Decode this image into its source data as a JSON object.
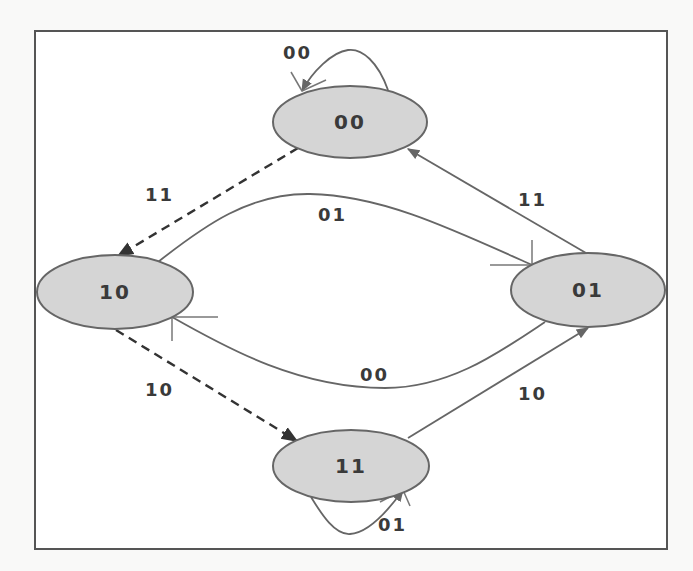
{
  "diagram": {
    "type": "state-transition",
    "states": [
      {
        "id": "s00",
        "label": "00"
      },
      {
        "id": "s01",
        "label": "01"
      },
      {
        "id": "s10",
        "label": "10"
      },
      {
        "id": "s11",
        "label": "11"
      }
    ],
    "transitions": [
      {
        "from": "00",
        "to": "00",
        "label": "00",
        "style": "solid"
      },
      {
        "from": "00",
        "to": "10",
        "label": "11",
        "style": "dashed"
      },
      {
        "from": "10",
        "to": "01",
        "label": "01",
        "style": "solid"
      },
      {
        "from": "01",
        "to": "00",
        "label": "11",
        "style": "solid"
      },
      {
        "from": "01",
        "to": "10",
        "label": "00",
        "style": "solid"
      },
      {
        "from": "10",
        "to": "11",
        "label": "10",
        "style": "dashed"
      },
      {
        "from": "11",
        "to": "01",
        "label": "10",
        "style": "solid"
      },
      {
        "from": "11",
        "to": "11",
        "label": "01",
        "style": "solid"
      }
    ],
    "colors": {
      "state_fill": "#d5d5d5",
      "state_stroke": "#666666",
      "text": "#3a3a3a",
      "frame": "#555555"
    }
  }
}
